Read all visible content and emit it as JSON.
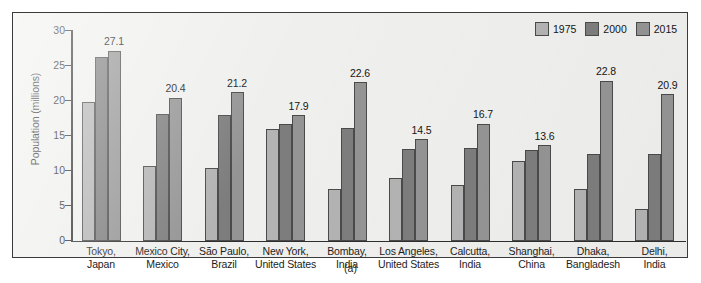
{
  "figure": {
    "caption": "(a)"
  },
  "legend": {
    "position": "top-right",
    "items": [
      {
        "label": "1975",
        "color": "#b3b3b3"
      },
      {
        "label": "2000",
        "color": "#7d7d7d"
      },
      {
        "label": "2015",
        "color": "#949494"
      }
    ]
  },
  "axes": {
    "ylabel": "Population (millions)",
    "xlabel": "",
    "yticks": [
      "0",
      "5",
      "10",
      "15",
      "20",
      "25",
      "30"
    ]
  },
  "chart_data": {
    "type": "bar",
    "title": "",
    "xlabel": "",
    "ylabel": "Population (millions)",
    "ylim": [
      0,
      30
    ],
    "ytick_values": [
      0,
      5,
      10,
      15,
      20,
      25,
      30
    ],
    "grid": false,
    "legend_position": "top-right",
    "categories": [
      "Tokyo, Japan",
      "Mexico City, Mexico",
      "São Paulo, Brazil",
      "New York, United States",
      "Bombay, India",
      "Los Angeles, United States",
      "Calcutta, India",
      "Shanghai, China",
      "Dhaka, Bangladesh",
      "Delhi, India"
    ],
    "category_lines": [
      [
        "Tokyo,",
        "Japan"
      ],
      [
        "Mexico City,",
        "Mexico"
      ],
      [
        "São Paulo,",
        "Brazil"
      ],
      [
        "New York,",
        "United States"
      ],
      [
        "Bombay,",
        "India"
      ],
      [
        "Los Angeles,",
        "United States"
      ],
      [
        "Calcutta,",
        "India"
      ],
      [
        "Shanghai,",
        "China"
      ],
      [
        "Dhaka,",
        "Bangladesh"
      ],
      [
        "Delhi,",
        "India"
      ]
    ],
    "series": [
      {
        "name": "1975",
        "color": "#b3b3b3",
        "values": [
          19.8,
          10.7,
          10.3,
          15.9,
          7.3,
          8.9,
          7.9,
          11.4,
          7.4,
          4.5
        ]
      },
      {
        "name": "2000",
        "color": "#7d7d7d",
        "values": [
          26.2,
          18.1,
          18.0,
          16.6,
          16.1,
          13.1,
          13.2,
          12.9,
          12.4,
          12.3
        ]
      },
      {
        "name": "2015",
        "color": "#949494",
        "values": [
          27.1,
          20.4,
          21.2,
          17.9,
          22.6,
          14.5,
          16.7,
          13.6,
          22.8,
          20.9
        ]
      }
    ],
    "data_labels": {
      "series": "2015",
      "values": [
        "27.1",
        "20.4",
        "21.2",
        "17.9",
        "22.6",
        "14.5",
        "16.7",
        "13.6",
        "22.8",
        "20.9"
      ]
    }
  }
}
